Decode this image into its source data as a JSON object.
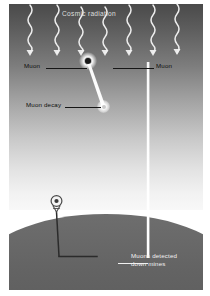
{
  "figure": {
    "kind": "physics-diagram"
  },
  "labels": {
    "title": "Cosmic radiation",
    "muon_left": "Muon",
    "muon_right": "Muon",
    "muon_decay": "Muon decay",
    "mines_line1": "Muons detected",
    "mines_line2": "down mines"
  },
  "icons": {
    "collision": "collision-burst-icon",
    "decay": "decay-point-icon",
    "headframe": "mine-headframe-icon",
    "ray_arrow": "down-arrow-icon"
  },
  "scene": {
    "cosmic_ray_count": 7,
    "cosmic_ray_x": [
      30,
      57,
      81,
      105,
      129,
      153,
      177
    ],
    "ray_top_y": 4,
    "ray_arrow_y": 50,
    "collision_point": {
      "x": 88,
      "y": 61
    },
    "decay_point": {
      "x": 103,
      "y": 106
    },
    "left_beam": {
      "x1": 88,
      "y1": 63,
      "x2": 103,
      "y2": 105
    },
    "right_beam": {
      "x": 148,
      "y_top": 66,
      "y_bottom": 258
    },
    "mine_shaft": {
      "x": 57,
      "y_top": 214,
      "y_bottom": 258,
      "drift_x2": 97
    },
    "ground_top_y": 206,
    "headframe": {
      "x": 56,
      "y": 205
    }
  },
  "colors": {
    "sky_top": "#4a4a4a",
    "sky_bottom": "#f8f8f8",
    "ground": "#5a5a5a",
    "beam": "#ffffff",
    "ray": "#f2f2f2",
    "label_dark": "#121212",
    "label_light": "#f2f2f2",
    "page": "#ffffff"
  }
}
